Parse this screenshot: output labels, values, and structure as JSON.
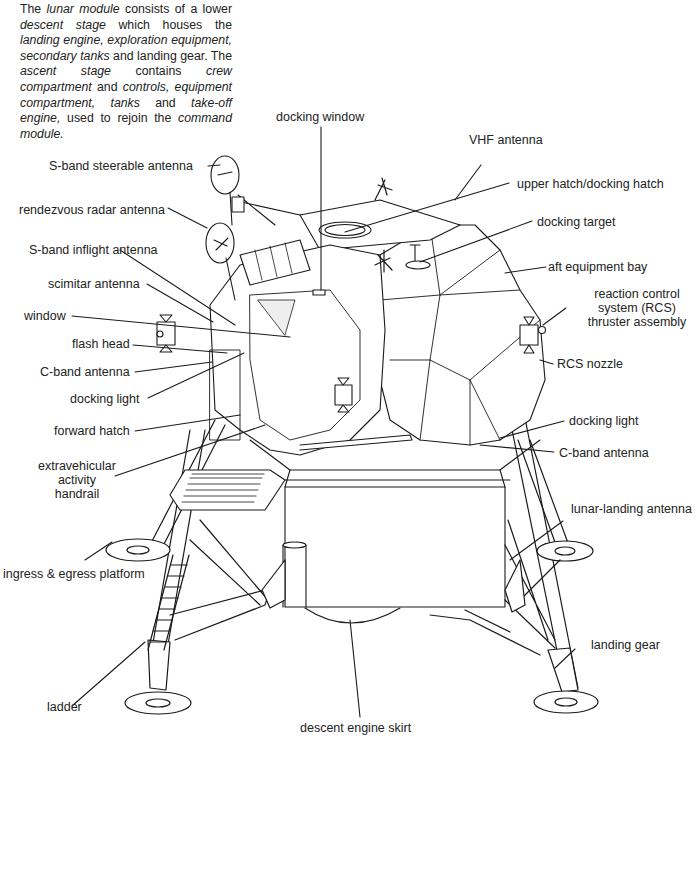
{
  "intro": {
    "segments": [
      {
        "t": "The ",
        "i": false
      },
      {
        "t": "lunar module",
        "i": true
      },
      {
        "t": " consists of a lower ",
        "i": false
      },
      {
        "t": "descent stage",
        "i": true
      },
      {
        "t": " which houses the ",
        "i": false
      },
      {
        "t": "landing engine, exploration equipment, secondary tanks",
        "i": true
      },
      {
        "t": " and landing gear. The ",
        "i": false
      },
      {
        "t": "ascent stage",
        "i": true
      },
      {
        "t": " contains ",
        "i": false
      },
      {
        "t": "crew compartment",
        "i": true
      },
      {
        "t": " and ",
        "i": false
      },
      {
        "t": "controls, equipment compartment, tanks",
        "i": true
      },
      {
        "t": " and ",
        "i": false
      },
      {
        "t": "take-off engine,",
        "i": true
      },
      {
        "t": " used to rejoin the ",
        "i": false
      },
      {
        "t": "command module.",
        "i": true
      }
    ]
  },
  "labels": {
    "docking_window": "docking window",
    "vhf_antenna": "VHF antenna",
    "s_band_steerable_antenna": "S-band steerable antenna",
    "upper_hatch": "upper hatch/docking hatch",
    "rendezvous_radar_antenna": "rendezvous radar antenna",
    "docking_target": "docking target",
    "s_band_inflight_antenna": "S-band inflight antenna",
    "aft_equipment_bay": "aft equipment bay",
    "scimitar_antenna": "scimitar antenna",
    "rcs_thruster_assembly": "reaction control system (RCS) thruster assembly",
    "window": "window",
    "flash_head": "flash head",
    "rcs_nozzle": "RCS nozzle",
    "c_band_antenna_left": "C-band antenna",
    "docking_light_left": "docking light",
    "docking_light_right": "docking light",
    "forward_hatch": "forward hatch",
    "c_band_antenna_right": "C-band antenna",
    "eva_handrail": "extravehicular activity handrail",
    "lunar_landing_antenna": "lunar-landing antenna",
    "ingress_egress_platform": "ingress & egress platform",
    "landing_gear": "landing gear",
    "ladder": "ladder",
    "descent_engine_skirt": "descent engine skirt"
  },
  "colors": {
    "ink": "#1a1a1a",
    "paper": "#ffffff"
  }
}
